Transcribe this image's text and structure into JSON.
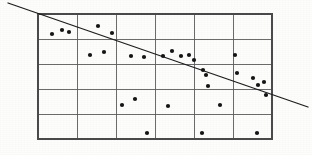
{
  "figure": {
    "title": "",
    "caption": ""
  },
  "chart_data": {
    "type": "scatter",
    "title": "",
    "subtitle": "",
    "xlabel": "",
    "ylabel": "",
    "xlim": [
      0,
      6
    ],
    "ylim": [
      0,
      5
    ],
    "grid": true,
    "grid_columns": 6,
    "grid_rows": 5,
    "legend": null,
    "legend_position": "none",
    "tick_labels_x": [],
    "tick_labels_y": [],
    "annotations": [],
    "point_radius": 2.1,
    "point_color": "#151515",
    "grid_color": "#5c5c5c",
    "line_color": "#1d1d1d",
    "plot_box": {
      "x0": 38,
      "y0": 14,
      "x1": 272,
      "y1": 139
    },
    "trend_line": {
      "name": "regression line",
      "x0": 8,
      "y0": 3,
      "x1": 308,
      "y1": 107,
      "direction": "negative"
    },
    "series": [
      {
        "name": "observations",
        "points": [
          [
            52,
            34
          ],
          [
            62,
            30
          ],
          [
            69,
            32
          ],
          [
            98,
            26
          ],
          [
            112,
            33
          ],
          [
            90,
            55
          ],
          [
            104,
            52
          ],
          [
            131,
            56
          ],
          [
            144,
            57
          ],
          [
            163,
            56
          ],
          [
            172,
            51
          ],
          [
            181,
            56
          ],
          [
            189,
            55
          ],
          [
            194,
            60
          ],
          [
            235,
            55
          ],
          [
            203,
            70
          ],
          [
            206,
            75
          ],
          [
            208,
            86
          ],
          [
            237,
            73
          ],
          [
            253,
            78
          ],
          [
            258,
            85
          ],
          [
            264,
            82
          ],
          [
            122,
            105
          ],
          [
            135,
            99
          ],
          [
            168,
            106
          ],
          [
            220,
            105
          ],
          [
            266,
            95
          ],
          [
            147,
            133
          ],
          [
            202,
            133
          ],
          [
            257,
            133
          ]
        ]
      }
    ]
  }
}
